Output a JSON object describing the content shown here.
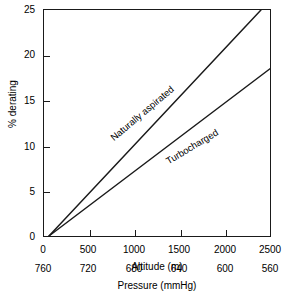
{
  "chart_data": {
    "type": "line",
    "title": "",
    "xlabel": "Altitude (m)",
    "ylabel": "% derating",
    "secondary_xlabel": "Pressure (mmHg)",
    "xlim": [
      0,
      2500
    ],
    "ylim": [
      0,
      25
    ],
    "grid": false,
    "legend": "inline-labels-on-curves",
    "x_ticks": [
      0,
      500,
      1000,
      1500,
      2000,
      2500
    ],
    "x_tick_labels": [
      "0",
      "500",
      "1000",
      "1500",
      "2000",
      "2500"
    ],
    "y_ticks": [
      0,
      5,
      10,
      15,
      20,
      25
    ],
    "y_tick_labels": [
      "0",
      "5",
      "10",
      "15",
      "20",
      "25"
    ],
    "secondary_x_ticks": [
      760,
      720,
      680,
      640,
      600,
      560
    ],
    "secondary_x_tick_labels": [
      "760",
      "720",
      "680",
      "640",
      "600",
      "560"
    ],
    "series": [
      {
        "name": "Naturally aspirated",
        "x": [
          55,
          2400
        ],
        "values": [
          0,
          25
        ]
      },
      {
        "name": "Turbocharged",
        "x": [
          55,
          2500
        ],
        "values": [
          0,
          18.5
        ]
      }
    ],
    "annotations": [
      {
        "text": "Naturally aspirated",
        "x": 1050,
        "y": 11.4,
        "rotation": -40
      },
      {
        "text": "Turbocharged",
        "x": 1500,
        "y": 9.0,
        "rotation": -31
      }
    ],
    "colors": {
      "line": "#1a1a1a",
      "axis": "#1a1a1a",
      "background": "#ffffff",
      "text": "#1a1a1a"
    }
  }
}
